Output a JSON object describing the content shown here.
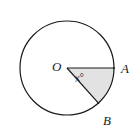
{
  "figure": {
    "type": "circle-with-shaded-sector",
    "background_color": "#ffffff",
    "stroke_color": "#1a1a1a",
    "sector_fill_color": "#e2e2e2",
    "circle": {
      "center_label": "O",
      "center_x": 67,
      "center_y": 68,
      "radius": 47
    },
    "labels": {
      "center": "O",
      "point_a": "A",
      "point_b": "B",
      "angle": "x°"
    },
    "points": {
      "A": {
        "label": "A",
        "angle_deg": 0,
        "x": 114,
        "y": 68
      },
      "B": {
        "label": "B",
        "angle_deg": -48,
        "x": 98,
        "y": 103
      }
    },
    "sector": {
      "vertex": "O",
      "from_point": "A",
      "to_point": "B",
      "angle_label": "x°",
      "shaded": true,
      "sweep_deg": 48
    }
  }
}
